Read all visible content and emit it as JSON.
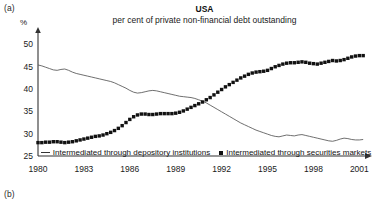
{
  "panels": {
    "a": "(a)",
    "b": "(b)"
  },
  "header": {
    "title": "USA",
    "subtitle": "per cent of private non-financial debt outstanding",
    "unit": "%"
  },
  "legend": {
    "line_label": "Intermediated through depository institutions",
    "marker_label": "Intermediated through securities markets",
    "line_icon": "line-swatch-icon",
    "marker_icon": "square-swatch-icon"
  },
  "colors": {
    "axis": "#333333",
    "line_series": "#555555",
    "marker_series": "#111111",
    "text": "#1a1a1a",
    "background": "#ffffff"
  },
  "chart_data": {
    "type": "line",
    "title": "USA",
    "subtitle": "per cent of private non-financial debt outstanding",
    "xlabel": "",
    "ylabel": "%",
    "xlim": [
      1980,
      2001.5
    ],
    "ylim": [
      25,
      51
    ],
    "grid": false,
    "legend_position": "bottom",
    "yticks": [
      25,
      30,
      35,
      40,
      45,
      50
    ],
    "xticks": [
      1980,
      1983,
      1986,
      1989,
      1992,
      1995,
      1998,
      2001
    ],
    "x": [
      1980,
      1980.25,
      1980.5,
      1980.75,
      1981,
      1981.25,
      1981.5,
      1981.75,
      1982,
      1982.25,
      1982.5,
      1982.75,
      1983,
      1983.25,
      1983.5,
      1983.75,
      1984,
      1984.25,
      1984.5,
      1984.75,
      1985,
      1985.25,
      1985.5,
      1985.75,
      1986,
      1986.25,
      1986.5,
      1986.75,
      1987,
      1987.25,
      1987.5,
      1987.75,
      1988,
      1988.25,
      1988.5,
      1988.75,
      1989,
      1989.25,
      1989.5,
      1989.75,
      1990,
      1990.25,
      1990.5,
      1990.75,
      1991,
      1991.25,
      1991.5,
      1991.75,
      1992,
      1992.25,
      1992.5,
      1992.75,
      1993,
      1993.25,
      1993.5,
      1993.75,
      1994,
      1994.25,
      1994.5,
      1994.75,
      1995,
      1995.25,
      1995.5,
      1995.75,
      1996,
      1996.25,
      1996.5,
      1996.75,
      1997,
      1997.25,
      1997.5,
      1997.75,
      1998,
      1998.25,
      1998.5,
      1998.75,
      1999,
      1999.25,
      1999.5,
      1999.75,
      2000,
      2000.25,
      2000.5,
      2000.75,
      2001,
      2001.25
    ],
    "series": [
      {
        "name": "Intermediated through depository institutions",
        "style": "line",
        "values": [
          45.4,
          45.2,
          44.9,
          44.6,
          44.3,
          44.2,
          44.4,
          44.5,
          44.2,
          43.8,
          43.5,
          43.3,
          43.1,
          42.9,
          42.7,
          42.5,
          42.3,
          42.1,
          41.9,
          41.7,
          41.4,
          41.0,
          40.6,
          40.2,
          39.7,
          39.3,
          39.1,
          39.2,
          39.4,
          39.6,
          39.7,
          39.6,
          39.4,
          39.2,
          39.0,
          38.8,
          38.6,
          38.4,
          38.3,
          38.2,
          38.1,
          37.9,
          37.6,
          37.3,
          36.9,
          36.4,
          35.9,
          35.4,
          34.9,
          34.4,
          33.9,
          33.4,
          32.9,
          32.4,
          32.0,
          31.6,
          31.2,
          30.8,
          30.5,
          30.2,
          29.9,
          29.6,
          29.4,
          29.3,
          29.5,
          29.7,
          29.6,
          29.5,
          29.7,
          29.8,
          29.6,
          29.4,
          29.2,
          29.0,
          28.8,
          28.6,
          28.4,
          28.3,
          28.5,
          28.8,
          29.0,
          28.9,
          28.7,
          28.6,
          28.6,
          28.7
        ]
      },
      {
        "name": "Intermediated through securities markets",
        "style": "markers",
        "values": [
          28.0,
          28.0,
          28.1,
          28.1,
          28.2,
          28.2,
          28.1,
          28.0,
          28.1,
          28.2,
          28.4,
          28.6,
          28.8,
          29.0,
          29.2,
          29.4,
          29.5,
          29.7,
          30.0,
          30.3,
          30.7,
          31.2,
          31.8,
          32.5,
          33.2,
          33.8,
          34.2,
          34.4,
          34.4,
          34.3,
          34.3,
          34.4,
          34.5,
          34.5,
          34.5,
          34.5,
          34.6,
          34.8,
          35.1,
          35.5,
          35.9,
          36.3,
          36.7,
          37.1,
          37.6,
          38.1,
          38.7,
          39.3,
          39.9,
          40.5,
          41.0,
          41.5,
          42.0,
          42.5,
          42.9,
          43.3,
          43.6,
          43.8,
          43.9,
          44.0,
          44.2,
          44.6,
          45.0,
          45.3,
          45.6,
          45.8,
          45.9,
          45.9,
          46.0,
          46.1,
          46.0,
          45.8,
          45.7,
          45.6,
          45.8,
          46.0,
          46.2,
          46.4,
          46.3,
          46.4,
          46.6,
          46.9,
          47.2,
          47.4,
          47.5,
          47.5
        ]
      }
    ]
  }
}
